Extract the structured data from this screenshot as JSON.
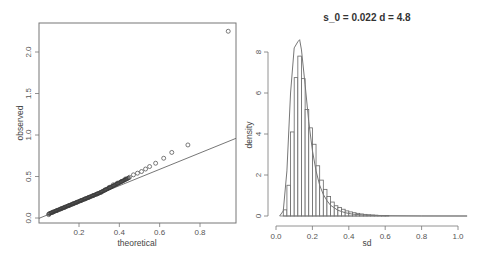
{
  "chart_data": [
    {
      "type": "scatter",
      "title": "",
      "xlabel": "theoretical",
      "ylabel": "observed",
      "xlim": [
        0.02,
        0.97
      ],
      "ylim": [
        -0.03,
        2.35
      ],
      "x_ticks": [
        "0.2",
        "0.4",
        "0.6",
        "0.8"
      ],
      "y_ticks": [
        "0.0",
        "0.5",
        "1.0",
        "1.5",
        "2.0"
      ],
      "grid": false,
      "reference_line": {
        "x0": 0.02,
        "y0": 0.02,
        "x1": 0.97,
        "y1": 0.96
      },
      "points": [
        [
          0.05,
          0.04
        ],
        [
          0.07,
          0.07
        ],
        [
          0.09,
          0.09
        ],
        [
          0.11,
          0.11
        ],
        [
          0.13,
          0.13
        ],
        [
          0.15,
          0.15
        ],
        [
          0.17,
          0.17
        ],
        [
          0.19,
          0.19
        ],
        [
          0.21,
          0.21
        ],
        [
          0.23,
          0.23
        ],
        [
          0.25,
          0.25
        ],
        [
          0.27,
          0.27
        ],
        [
          0.29,
          0.29
        ],
        [
          0.31,
          0.31
        ],
        [
          0.33,
          0.34
        ],
        [
          0.35,
          0.37
        ],
        [
          0.37,
          0.4
        ],
        [
          0.39,
          0.42
        ],
        [
          0.41,
          0.44
        ],
        [
          0.43,
          0.47
        ],
        [
          0.45,
          0.49
        ],
        [
          0.47,
          0.52
        ],
        [
          0.49,
          0.54
        ],
        [
          0.51,
          0.56
        ],
        [
          0.53,
          0.59
        ],
        [
          0.55,
          0.62
        ],
        [
          0.58,
          0.66
        ],
        [
          0.62,
          0.72
        ],
        [
          0.66,
          0.79
        ],
        [
          0.74,
          0.88
        ],
        [
          0.94,
          2.25
        ]
      ]
    },
    {
      "type": "bar",
      "title": "s_0 = 0.022 d = 4.8",
      "xlabel": "sd",
      "ylabel": "density",
      "xlim": [
        0.0,
        1.05
      ],
      "ylim": [
        0,
        8.6
      ],
      "x_ticks": [
        "0.0",
        "0.2",
        "0.4",
        "0.6",
        "0.8",
        "1.0"
      ],
      "y_ticks": [
        "0",
        "2",
        "4",
        "6",
        "8"
      ],
      "grid": false,
      "bin_width": 0.02,
      "bin_starts": [
        0.04,
        0.06,
        0.08,
        0.1,
        0.12,
        0.14,
        0.16,
        0.18,
        0.2,
        0.22,
        0.24,
        0.26,
        0.28,
        0.3,
        0.32,
        0.34,
        0.36,
        0.38,
        0.4,
        0.42,
        0.44,
        0.46,
        0.48,
        0.5,
        0.52,
        0.54,
        0.56,
        0.58,
        0.6
      ],
      "values": [
        0.3,
        1.5,
        4.1,
        6.75,
        7.8,
        6.7,
        5.2,
        4.3,
        3.5,
        2.45,
        1.75,
        1.3,
        0.95,
        0.68,
        0.5,
        0.42,
        0.33,
        0.25,
        0.2,
        0.16,
        0.13,
        0.1,
        0.08,
        0.06,
        0.05,
        0.04,
        0.03,
        0.02,
        0.02
      ],
      "density_curve": {
        "x": [
          0.02,
          0.04,
          0.06,
          0.08,
          0.1,
          0.12,
          0.13,
          0.14,
          0.16,
          0.18,
          0.2,
          0.22,
          0.24,
          0.26,
          0.28,
          0.3,
          0.34,
          0.38,
          0.42,
          0.5,
          0.6,
          0.8,
          1.05
        ],
        "y": [
          0.0,
          0.25,
          2.2,
          6.0,
          8.2,
          8.5,
          8.6,
          8.1,
          6.4,
          4.6,
          3.2,
          2.2,
          1.5,
          1.05,
          0.75,
          0.52,
          0.28,
          0.16,
          0.09,
          0.04,
          0.015,
          0.003,
          0.0
        ]
      }
    }
  ]
}
